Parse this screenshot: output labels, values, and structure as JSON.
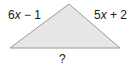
{
  "diagram": {
    "type": "triangle",
    "vertices": {
      "apex": [
        69,
        4
      ],
      "bottom_left": [
        10,
        48
      ],
      "bottom_right": [
        120,
        48
      ]
    },
    "fill_color": "#e6e6e6",
    "stroke_color": "#9a9a9a",
    "sides": {
      "left": {
        "coef": "6",
        "var": "x",
        "rest": " − 1"
      },
      "right": {
        "coef": "5",
        "var": "x",
        "rest": " + 2"
      },
      "base": {
        "label": "?"
      }
    }
  }
}
